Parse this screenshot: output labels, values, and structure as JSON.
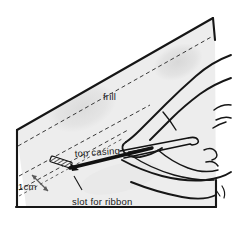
{
  "illustration": {
    "title": "Sewing diagram: threading ribbon through top casing of a frill",
    "subject": "hand-threading-ribbon-into-casing",
    "canvas": {
      "width": 232,
      "height": 243
    },
    "colors": {
      "fabric_fill": "#ededed",
      "fabric_shadow": "#e0e0e0",
      "outline": "#161616",
      "dashed_line": "#3a3a3a",
      "label_text": "#1a1a1a",
      "background": "#ffffff",
      "arrow": "#5a5a5a",
      "slot_mark": "#111111"
    },
    "labels": [
      {
        "id": "frill",
        "text": "frill",
        "x": 103,
        "y": 100,
        "anchor": "start",
        "has_leader": false
      },
      {
        "id": "top-casing",
        "text": "top casing",
        "x": 75,
        "y": 157,
        "anchor": "start",
        "has_leader": true
      },
      {
        "id": "one-cm",
        "text": "1cm",
        "x": 18,
        "y": 190,
        "anchor": "start",
        "has_leader": false
      },
      {
        "id": "slot-for-ribbon",
        "text": "slot for ribbon",
        "x": 72,
        "y": 205,
        "anchor": "start",
        "has_leader": true
      }
    ],
    "measurement": {
      "id": "casing-width",
      "value": "1cm",
      "arrow_type": "double-headed",
      "from": {
        "x": 31,
        "y": 176
      },
      "to": {
        "x": 48,
        "y": 192
      }
    },
    "elements": {
      "fabric_panel": "frill fabric panel with diagonal upper edge",
      "dashed_fold_line": "upper dashed stitching line for casing",
      "dashed_casing_lines": "pair of parallel dashed lines forming the casing channel",
      "slot_mark": "hatched rectangle marking the cut slot for ribbon",
      "hand": "hand outline with thumb and fingers",
      "bodkin": "bodkin / needle tool pushing ribbon through casing",
      "ribbon": "ribbon loop emerging from hand"
    }
  }
}
